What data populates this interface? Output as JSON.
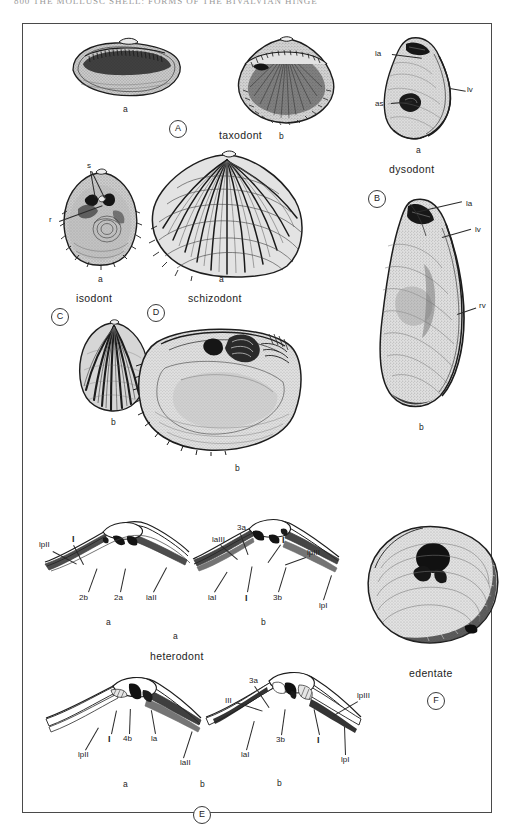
{
  "page": {
    "running_head": "800   THE MOLLUSC SHELL: FORMS OF THE BIVALVIAN HINGE",
    "plate_caption": ""
  },
  "figure": {
    "panels": [
      {
        "key": "A",
        "panel_letter": "A",
        "type_label": "taxodont",
        "specimens": [
          {
            "tag": "a",
            "caption": "a",
            "description": "interior of left valve with row of small transverse teeth"
          },
          {
            "tag": "b",
            "caption": "b",
            "description": "interior of valve showing arched taxodont tooth row"
          }
        ],
        "anatomy_labels": []
      },
      {
        "key": "B",
        "panel_letter": "B",
        "type_label": "dysodont",
        "specimens": [
          {
            "tag": "a",
            "caption": "a",
            "description": "oyster-like valve, exterior"
          },
          {
            "tag": "b",
            "caption": "b",
            "description": "large elongate oyster valve"
          }
        ],
        "anatomy_labels": [
          "la",
          "lv",
          "as",
          "la",
          "lv",
          "rv"
        ]
      },
      {
        "key": "C",
        "panel_letter": "C",
        "type_label": "isodont",
        "specimens": [
          {
            "tag": "a",
            "caption": "a",
            "description": "interior view with paired sockets and ridge"
          },
          {
            "tag": "b",
            "caption": "b",
            "description": "exterior of ribbed valve"
          }
        ],
        "anatomy_labels": [
          "s",
          "r"
        ]
      },
      {
        "key": "D",
        "panel_letter": "D",
        "type_label": "schizodont",
        "specimens": [
          {
            "tag": "a",
            "caption": "a",
            "description": "strongly radially ribbed valve exterior"
          },
          {
            "tag": "b",
            "caption": "b",
            "description": "interior of valve showing split cardinal tooth"
          }
        ],
        "anatomy_labels": []
      },
      {
        "key": "E",
        "panel_letter": "E",
        "type_label": "heterodont",
        "specimens": [
          {
            "tag": "a",
            "caption": "a",
            "description": "hinge line, upper-left diagram"
          },
          {
            "tag": "b",
            "caption": "b",
            "description": "hinge line, upper-right diagram"
          },
          {
            "tag": "a",
            "caption": "a",
            "description": "hinge line, lower-left diagram"
          },
          {
            "tag": "b",
            "caption": "b",
            "description": "hinge line, lower-right diagram"
          }
        ],
        "anatomy_labels": [
          "lpII",
          "I",
          "2b",
          "2a",
          "laII",
          "3a",
          "laIII",
          "I",
          "lpIII",
          "laI",
          "I",
          "3b",
          "lpI",
          "lpII",
          "I",
          "4b",
          "la",
          "laII",
          "3a",
          "III",
          "lpIII",
          "laI",
          "3b",
          "I",
          "lpI"
        ]
      },
      {
        "key": "F",
        "panel_letter": "F",
        "type_label": "edentate",
        "specimens": [
          {
            "tag": "",
            "caption": "",
            "description": "interior of valve lacking hinge teeth"
          }
        ],
        "anatomy_labels": []
      }
    ]
  },
  "labels": {
    "taxodont": "taxodont",
    "dysodont": "dysodont",
    "isodont": "isodont",
    "schizodont": "schizodont",
    "heterodont": "heterodont",
    "edentate": "edentate",
    "a": "a",
    "b": "b",
    "A": "A",
    "B": "B",
    "C": "C",
    "D": "D",
    "E": "E",
    "F": "F",
    "la": "la",
    "lv": "lv",
    "rv": "rv",
    "as": "as",
    "s": "s",
    "r": "r",
    "I": "I",
    "III": "III",
    "2a": "2a",
    "2b": "2b",
    "3a": "3a",
    "3b": "3b",
    "4b": "4b",
    "laI": "laI",
    "laII": "laII",
    "laIII": "laIII",
    "lpI": "lpI",
    "lpII": "lpII",
    "lpIII": "lpIII"
  },
  "colors": {
    "ink": "#1d1d1d",
    "frame": "#4a4a4a",
    "paper": "#ffffff",
    "shade_light": "#d9d9d9",
    "shade_mid": "#9b9b9b",
    "shade_dark": "#3a3a3a",
    "running_head": "#9a9a9a"
  }
}
